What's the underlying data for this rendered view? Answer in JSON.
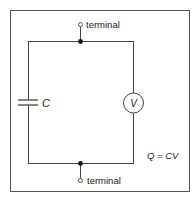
{
  "diagram": {
    "type": "circuit",
    "top_terminal_label": "terminal",
    "bottom_terminal_label": "terminal",
    "capacitor_label": "C",
    "voltmeter_label": "V",
    "equation": "Q = CV",
    "colors": {
      "line": "#444444",
      "frame": "#555555",
      "text": "#222222"
    }
  }
}
